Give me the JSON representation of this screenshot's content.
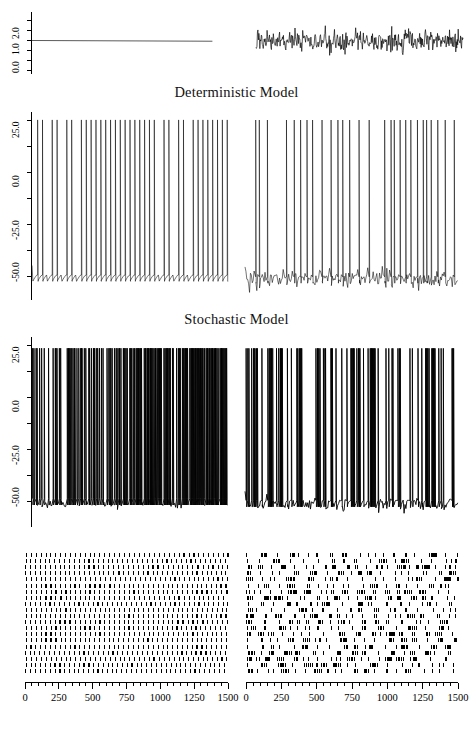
{
  "figure": {
    "width": 473,
    "height": 737,
    "background": "#ffffff",
    "foreground": "#000000"
  },
  "titles": {
    "deterministic": "Deterministic Model",
    "stochastic": "Stochastic Model"
  },
  "axes": {
    "x_ticks_major": [
      0,
      250,
      500,
      750,
      1000,
      1250,
      1500
    ],
    "x_tick_labels": [
      "0",
      "250",
      "500",
      "750",
      "1000",
      "1250",
      "1500"
    ],
    "x_range": [
      0,
      1500
    ],
    "y_input_ticks": [
      0.0,
      1.0,
      2.0
    ],
    "y_input_tick_labels": [
      "0.0",
      "1.0",
      "2.0"
    ],
    "y_input_range": [
      -0.3,
      2.6
    ],
    "y_voltage_ticks": [
      25.0,
      0.0,
      -25.0,
      -50.0
    ],
    "y_voltage_tick_labels": [
      "25.0",
      "0.0",
      "-25.0",
      "-50.0"
    ],
    "y_voltage_range": [
      -80,
      35
    ]
  },
  "chart_data": {
    "type": "line",
    "xlabel": "",
    "ylabel": "",
    "panels": [
      {
        "id": "input-deterministic",
        "row": 1,
        "column": "left",
        "kind": "input-current",
        "description": "Constant deterministic input current, flat at 1.0",
        "ylabel_ticks": [
          "0.0",
          "1.0",
          "2.0"
        ],
        "ylim": [
          -0.3,
          2.6
        ],
        "xlim": [
          0,
          1500
        ],
        "series": [
          {
            "name": "I(t) deterministic",
            "mean": 1.0,
            "noise_sd": 0.0,
            "constant": true
          }
        ]
      },
      {
        "id": "input-stochastic",
        "row": 1,
        "column": "right",
        "kind": "input-current",
        "description": "Noisy stochastic input current fluctuating about 1.0",
        "ylim": [
          -0.3,
          2.6
        ],
        "xlim": [
          0,
          1500
        ],
        "series": [
          {
            "name": "I(t) stochastic",
            "mean": 1.0,
            "noise_sd": 0.42,
            "constant": false
          }
        ]
      },
      {
        "id": "voltage-deterministic-regular",
        "row": 2,
        "column": "left",
        "kind": "membrane-voltage",
        "description": "Deterministic model, regular periodic spike train",
        "ylabel_ticks": [
          "25.0",
          "0.0",
          "-25.0",
          "-50.0"
        ],
        "ylim": [
          -80,
          35
        ],
        "xlim": [
          0,
          1500
        ],
        "spike_peak": 30,
        "spike_reset": -72,
        "resting": -62,
        "period": 37,
        "regularity": "periodic",
        "spike_count": 40
      },
      {
        "id": "voltage-deterministic-noisy",
        "row": 2,
        "column": "right",
        "kind": "membrane-voltage",
        "description": "Deterministic model driven with noisy input, irregular spike train",
        "ylim": [
          -80,
          35
        ],
        "xlim": [
          0,
          1500
        ],
        "spike_peak": 30,
        "spike_reset": -72,
        "resting": -62,
        "regularity": "irregular",
        "spike_count": 34
      },
      {
        "id": "voltage-stochastic-regular",
        "row": 3,
        "column": "left",
        "kind": "membrane-voltage",
        "description": "Stochastic model, dense high-frequency bursting spike train",
        "ylabel_ticks": [
          "25.0",
          "0.0",
          "-25.0",
          "-50.0"
        ],
        "ylim": [
          -80,
          35
        ],
        "xlim": [
          0,
          1500
        ],
        "spike_peak": 28,
        "spike_reset": -70,
        "resting": -60,
        "regularity": "dense-burst",
        "spike_count": 220
      },
      {
        "id": "voltage-stochastic-noisy",
        "row": 3,
        "column": "right",
        "kind": "membrane-voltage",
        "description": "Stochastic model with noisy input, clustered burst spiking",
        "ylim": [
          -80,
          35
        ],
        "xlim": [
          0,
          1500
        ],
        "spike_peak": 28,
        "spike_reset": -70,
        "resting": -60,
        "regularity": "clustered-burst",
        "spike_count": 150
      },
      {
        "id": "raster-deterministic",
        "row": 4,
        "column": "left",
        "kind": "raster",
        "description": "Raster plot of deterministic trials, regularly spaced spike marks",
        "xlim": [
          0,
          1500
        ],
        "trials": 20,
        "regularity": "regular"
      },
      {
        "id": "raster-stochastic",
        "row": 4,
        "column": "right",
        "kind": "raster",
        "description": "Raster plot of stochastic trials, irregular clustered spike marks",
        "xlim": [
          0,
          1500
        ],
        "trials": 20,
        "regularity": "irregular"
      }
    ]
  }
}
